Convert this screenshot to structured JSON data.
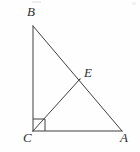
{
  "figure": {
    "kind": "geometry-diagram",
    "width": 140,
    "height": 152,
    "background_color": "#fefefe",
    "stroke_color": "#3f3f3f",
    "label_color": "#2f2f2f",
    "stroke_width": 1
  },
  "points": {
    "B": {
      "label": "B",
      "x": 33,
      "y": 26
    },
    "C": {
      "label": "C",
      "x": 33,
      "y": 131
    },
    "A": {
      "label": "A",
      "x": 122,
      "y": 131
    },
    "E": {
      "label": "E",
      "x": 80,
      "y": 79
    }
  },
  "segments": [
    {
      "name": "BC",
      "from": "B",
      "to": "C",
      "x1": 33,
      "y1": 26,
      "x2": 33,
      "y2": 131
    },
    {
      "name": "CA",
      "from": "C",
      "to": "A",
      "x1": 33,
      "y1": 131,
      "x2": 122,
      "y2": 131
    },
    {
      "name": "BA",
      "from": "B",
      "to": "A",
      "x1": 33,
      "y1": 26,
      "x2": 122,
      "y2": 131
    },
    {
      "name": "CE",
      "from": "C",
      "to": "E",
      "x1": 33,
      "y1": 131,
      "x2": 80,
      "y2": 79
    }
  ],
  "right_angle_marker": {
    "at": "C",
    "points": "33,119 45,119 45,131 33,131",
    "size": 12
  },
  "labels": {
    "B": "B",
    "C": "C",
    "A": "A",
    "E": "E"
  }
}
